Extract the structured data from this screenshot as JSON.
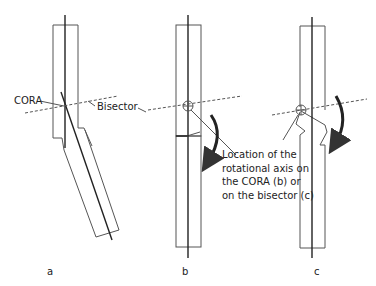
{
  "figure": {
    "labels": {
      "cora": "CORA",
      "bisector": "Bisector",
      "description": [
        "Location of the",
        "rotational axis on",
        "the CORA (b) or",
        "on the bisector (c)"
      ]
    },
    "panels": [
      {
        "id": "a",
        "label": "a"
      },
      {
        "id": "b",
        "label": "b"
      },
      {
        "id": "c",
        "label": "c"
      }
    ],
    "colors": {
      "line": "#444444",
      "axis": "#222222",
      "background": "#ffffff"
    }
  }
}
